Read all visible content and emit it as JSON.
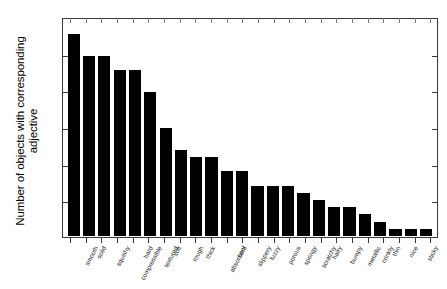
{
  "chart_data": {
    "type": "bar",
    "title": "",
    "subtitle": "",
    "xlabel": "",
    "ylabel": "Number of objects with corresponding\nadjective",
    "ylim": [
      0,
      300
    ],
    "yticks": [
      0,
      50,
      100,
      150,
      200,
      250,
      300
    ],
    "ytick_labels": [
      "0",
      "50",
      "100",
      "150",
      "200",
      "250",
      "300"
    ],
    "grid": false,
    "legend": null,
    "bar_color": "#000000",
    "axis_color": "#3a3a3a",
    "background": "#ffffff",
    "categories": [
      "smooth",
      "solid",
      "squishy",
      "compressible",
      "hard",
      "textured",
      "soft",
      "rough",
      "thick",
      "absorbent",
      "cool",
      "slippery",
      "fuzzy",
      "porous",
      "springy",
      "scratchy",
      "hairy",
      "bumpy",
      "metallic",
      "crinkly",
      "thin",
      "nice",
      "sticky",
      "unpleasant"
    ],
    "values": [
      280,
      250,
      250,
      230,
      230,
      200,
      150,
      120,
      110,
      110,
      90,
      90,
      70,
      70,
      70,
      60,
      50,
      40,
      40,
      30,
      20,
      10,
      10,
      10
    ]
  }
}
